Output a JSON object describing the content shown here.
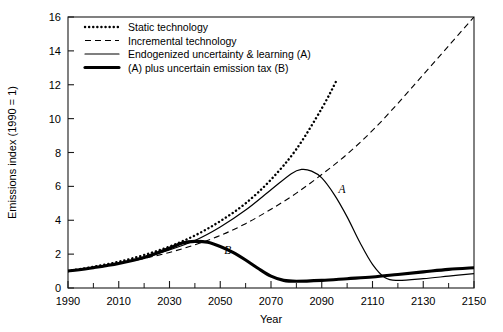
{
  "chart_data": {
    "type": "line",
    "title": "",
    "xlabel": "Year",
    "ylabel": "Emissions index (1990 = 1)",
    "xlim": [
      1990,
      2150
    ],
    "ylim": [
      0,
      16
    ],
    "xticks": [
      1990,
      2010,
      2030,
      2050,
      2070,
      2090,
      2110,
      2130,
      2150
    ],
    "xticks_minor": [
      2000,
      2020,
      2040,
      2060,
      2080,
      2100,
      2120,
      2140
    ],
    "yticks": [
      0,
      2,
      4,
      6,
      8,
      10,
      12,
      14,
      16
    ],
    "grid": false,
    "legend_position": "top-left",
    "series": [
      {
        "name": "Static technology",
        "style": "dotted",
        "x": [
          1990,
          2000,
          2010,
          2020,
          2030,
          2040,
          2050,
          2060,
          2070,
          2080,
          2090,
          2096
        ],
        "y": [
          1.0,
          1.25,
          1.55,
          1.95,
          2.45,
          3.1,
          3.95,
          5.0,
          6.4,
          8.2,
          10.6,
          12.3
        ]
      },
      {
        "name": "Incremental technology",
        "style": "dashed",
        "x": [
          1990,
          2000,
          2010,
          2020,
          2030,
          2040,
          2050,
          2060,
          2070,
          2080,
          2090,
          2100,
          2110,
          2120,
          2130,
          2140,
          2150
        ],
        "y": [
          1.0,
          1.2,
          1.45,
          1.75,
          2.1,
          2.55,
          3.1,
          3.8,
          4.65,
          5.6,
          6.7,
          7.9,
          9.3,
          10.9,
          12.6,
          14.3,
          16.0
        ]
      },
      {
        "name": "Endogenized uncertainty & learning (A)",
        "style": "solid-thin",
        "tag": "A",
        "x": [
          1990,
          2000,
          2010,
          2020,
          2030,
          2040,
          2050,
          2060,
          2070,
          2078,
          2082,
          2086,
          2090,
          2095,
          2100,
          2105,
          2110,
          2115,
          2120,
          2130,
          2140,
          2150
        ],
        "y": [
          1.0,
          1.2,
          1.45,
          1.8,
          2.25,
          2.8,
          3.6,
          4.6,
          5.8,
          6.75,
          7.0,
          6.9,
          6.5,
          5.5,
          4.2,
          2.7,
          1.4,
          0.6,
          0.45,
          0.55,
          0.7,
          0.85
        ]
      },
      {
        "name": "(A) plus uncertain emission tax (B)",
        "style": "solid-thick",
        "tag": "B",
        "x": [
          1990,
          2000,
          2010,
          2020,
          2030,
          2035,
          2040,
          2045,
          2050,
          2055,
          2060,
          2065,
          2070,
          2075,
          2080,
          2090,
          2100,
          2110,
          2120,
          2130,
          2140,
          2150
        ],
        "y": [
          1.0,
          1.2,
          1.45,
          1.8,
          2.35,
          2.65,
          2.75,
          2.7,
          2.45,
          2.1,
          1.65,
          1.15,
          0.7,
          0.45,
          0.4,
          0.45,
          0.55,
          0.65,
          0.8,
          0.95,
          1.1,
          1.2
        ]
      }
    ],
    "annotations": [
      {
        "text": "A",
        "x": 2098,
        "y": 5.6
      },
      {
        "text": "B",
        "x": 2053,
        "y": 2.0
      }
    ]
  },
  "legend": {
    "items": [
      {
        "label": "Static technology",
        "style": "dotted"
      },
      {
        "label": "Incremental technology",
        "style": "dashed"
      },
      {
        "label": "Endogenized uncertainty & learning (A)",
        "style": "solid-thin"
      },
      {
        "label": "(A) plus uncertain emission tax (B)",
        "style": "solid-thick"
      }
    ]
  },
  "axes": {
    "y_title": "Emissions index (1990 = 1)",
    "x_title": "Year",
    "y_tick_labels": [
      "0",
      "2",
      "4",
      "6",
      "8",
      "10",
      "12",
      "14",
      "16"
    ],
    "x_tick_labels": [
      "1990",
      "2010",
      "2030",
      "2050",
      "2070",
      "2090",
      "2110",
      "2130",
      "2150"
    ]
  },
  "colors": {
    "line": "#000000",
    "background": "#ffffff",
    "axis": "#1a1a1a"
  }
}
